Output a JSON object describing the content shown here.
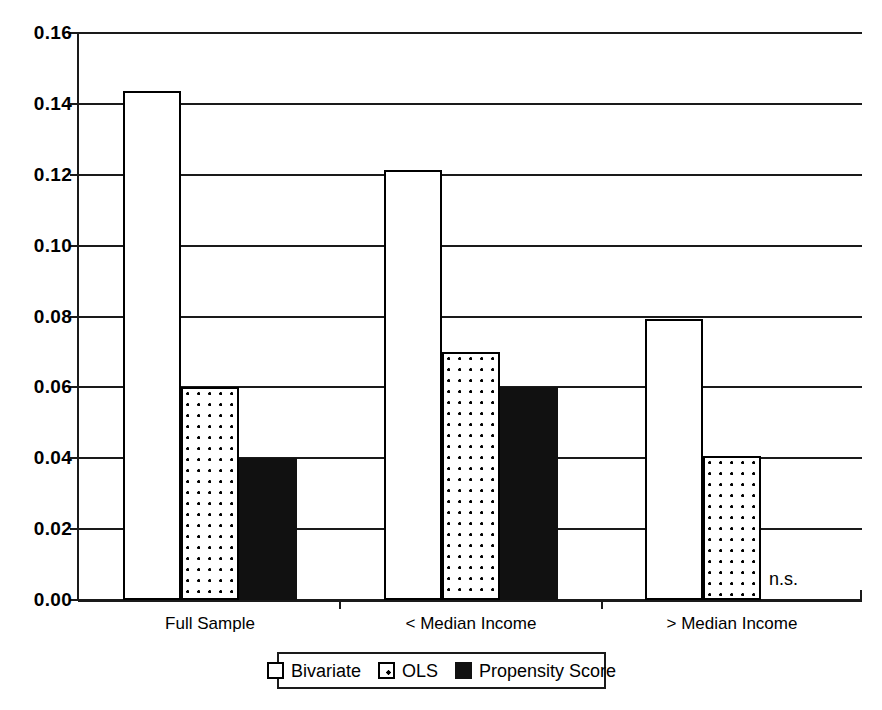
{
  "chart_data": {
    "type": "bar",
    "title": "",
    "subtitle": "",
    "xlabel": "",
    "ylabel": "",
    "categories": [
      "Full Sample",
      "< Median Income",
      "> Median Income"
    ],
    "series": [
      {
        "name": "Bivariate",
        "fill": "open",
        "values": [
          0.1435,
          0.1213,
          0.0792
        ]
      },
      {
        "name": "OLS",
        "fill": "dotted",
        "values": [
          0.06,
          0.07,
          0.0405
        ]
      },
      {
        "name": "Propensity Score",
        "fill": "solid",
        "values": [
          0.04,
          0.06,
          null
        ]
      }
    ],
    "ylim": [
      0.0,
      0.16
    ],
    "ytick_values": [
      0.0,
      0.02,
      0.04,
      0.06,
      0.08,
      0.1,
      0.12,
      0.14,
      0.16
    ],
    "ytick_labels": [
      "0.00",
      "0.02",
      "0.04",
      "0.06",
      "0.08",
      "0.10",
      "0.12",
      "0.14",
      "0.16"
    ],
    "grid": true,
    "grid_axis": "y",
    "legend_position": "bottom",
    "annotations": [
      {
        "text": "n.s.",
        "category_index": 2,
        "series_index": 2
      }
    ],
    "colors": {
      "axis": "#1a1a1a",
      "bar_outline": "#000000",
      "bar_open_fill": "#ffffff",
      "bar_solid_fill": "#111111",
      "background": "#ffffff"
    }
  },
  "legend": {
    "items": [
      {
        "label": "Bivariate",
        "swatch": "open-square-icon"
      },
      {
        "label": "OLS",
        "swatch": "dotted-square-icon"
      },
      {
        "label": "Propensity Score",
        "swatch": "filled-square-icon"
      }
    ]
  },
  "axis": {
    "y_labels": [
      "0.16",
      "0.14",
      "0.12",
      "0.10",
      "0.08",
      "0.06",
      "0.04",
      "0.02",
      "0.00"
    ],
    "x_labels": [
      "Full Sample",
      "< Median Income",
      "> Median Income"
    ]
  },
  "annotation": {
    "not_significant": "n.s."
  }
}
